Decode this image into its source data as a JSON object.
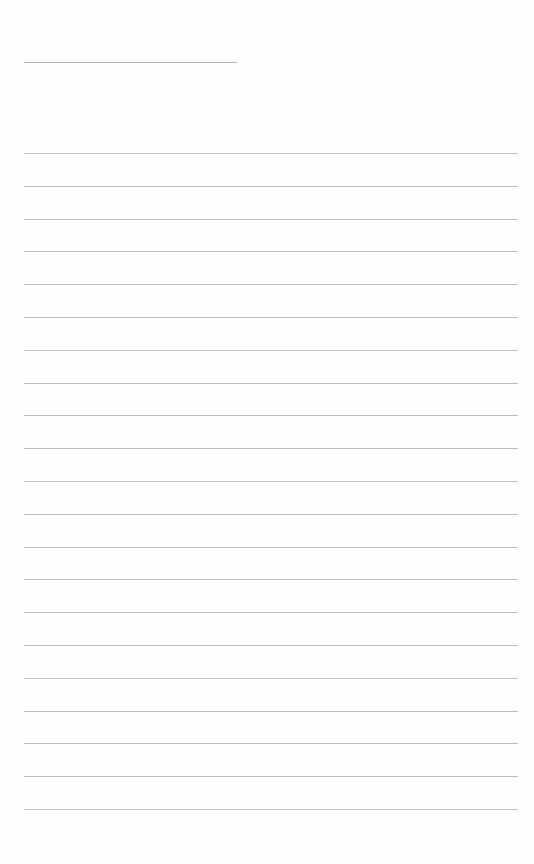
{
  "document": {
    "type": "blank lined writing sheet",
    "title_line": {
      "present": true
    },
    "ruled_lines": {
      "count": 21,
      "first_y": 153,
      "spacing": 32.8,
      "color": "#bdbdbd"
    },
    "text": ""
  }
}
